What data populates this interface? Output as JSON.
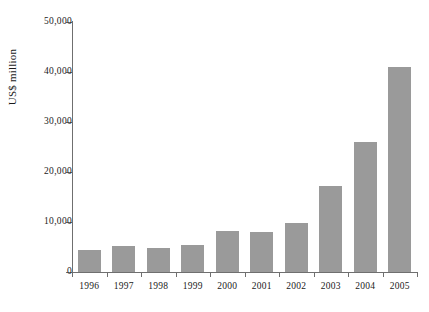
{
  "chart_data": {
    "type": "bar",
    "title": "",
    "subtitle": "",
    "xlabel": "",
    "ylabel": "US$ million",
    "categories": [
      "1996",
      "1997",
      "1998",
      "1999",
      "2000",
      "2001",
      "2002",
      "2003",
      "2004",
      "2005"
    ],
    "values": [
      4400,
      5200,
      4800,
      5400,
      8200,
      8000,
      9800,
      17200,
      26000,
      41000
    ],
    "series": [
      {
        "name": "US$ million",
        "values": [
          4400,
          5200,
          4800,
          5400,
          8200,
          8000,
          9800,
          17200,
          26000,
          41000
        ]
      }
    ],
    "ylim": [
      0,
      50000
    ],
    "ytick_values": [
      0,
      10000,
      20000,
      30000,
      40000,
      50000
    ],
    "ytick_labels": [
      "0",
      "10,000",
      "20,000",
      "30,000",
      "40,000",
      "50,000"
    ],
    "xtick_labels": [
      "1996",
      "1997",
      "1998",
      "1999",
      "2000",
      "2001",
      "2002",
      "2003",
      "2004",
      "2005"
    ],
    "grid": false,
    "legend": null,
    "legend_position": "none",
    "bar_color": "#9a9a9a",
    "axis_color": "#6f6f6f",
    "background_color": "#ffffff"
  }
}
